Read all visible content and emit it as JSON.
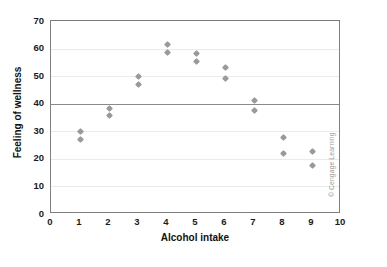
{
  "chart_data": {
    "type": "scatter",
    "title": "",
    "xlabel": "Alcohol intake",
    "ylabel": "Feeling of wellness",
    "xlim": [
      0,
      10
    ],
    "ylim": [
      0,
      70
    ],
    "xticks": [
      "0",
      "1",
      "2",
      "3",
      "4",
      "5",
      "6",
      "7",
      "8",
      "9",
      "10"
    ],
    "yticks": [
      "0",
      "10",
      "20",
      "30",
      "40",
      "50",
      "60",
      "70"
    ],
    "grid": "horizontal",
    "legend": "none",
    "reference_line_y": 40,
    "marker_shape": "diamond",
    "marker_color": "#9a9a9a",
    "points": [
      {
        "x": 1,
        "y": 30.0
      },
      {
        "x": 1,
        "y": 27.0
      },
      {
        "x": 2,
        "y": 38.2
      },
      {
        "x": 2,
        "y": 35.8
      },
      {
        "x": 3,
        "y": 49.9
      },
      {
        "x": 3,
        "y": 46.9
      },
      {
        "x": 4,
        "y": 61.4
      },
      {
        "x": 4,
        "y": 58.4
      },
      {
        "x": 5,
        "y": 58.3
      },
      {
        "x": 5,
        "y": 55.3
      },
      {
        "x": 6,
        "y": 53.0
      },
      {
        "x": 6,
        "y": 49.1
      },
      {
        "x": 7,
        "y": 41.3
      },
      {
        "x": 7,
        "y": 37.5
      },
      {
        "x": 8,
        "y": 27.6
      },
      {
        "x": 8,
        "y": 22.0
      },
      {
        "x": 9,
        "y": 22.8
      },
      {
        "x": 9,
        "y": 17.7
      }
    ]
  },
  "credit": "© Cengage Learning"
}
